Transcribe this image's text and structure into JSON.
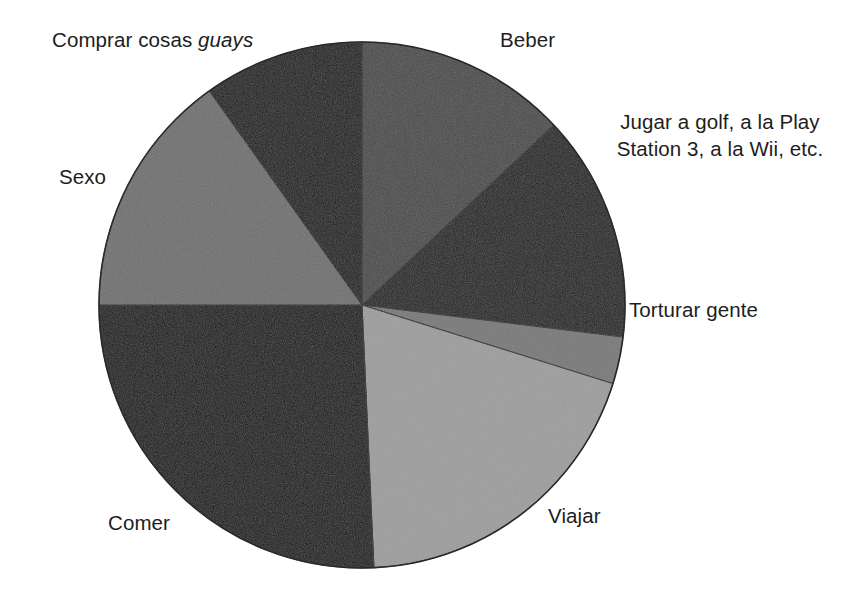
{
  "figure": {
    "background_color": "#ffffff",
    "outline_color": "#1a1a1a"
  },
  "chart_data": {
    "type": "pie",
    "title": "",
    "subtitle": "",
    "xlabel": "",
    "ylabel": "",
    "grid": false,
    "legend_position": "none",
    "label_placement": "outside-callout",
    "start_angle_deg": 0,
    "direction": "clockwise",
    "center": {
      "x": 362,
      "y": 305
    },
    "radius": 263,
    "categories": [
      "Beber",
      "Jugar a golf, a la Play Station 3, a la Wii, etc.",
      "Torturar gente",
      "Viajar",
      "Comer",
      "Sexo",
      "Comprar cosas guays"
    ],
    "values": [
      13.0,
      13.9,
      2.9,
      19.4,
      25.8,
      15.1,
      9.9
    ],
    "value_unit": "percent",
    "slices": [
      {
        "label": "Beber",
        "label_html": "Beber",
        "value": 13.0,
        "start_deg": 0.0,
        "end_deg": 46.8,
        "color": "#4a4a4a"
      },
      {
        "label": "Jugar a golf, a la Play Station 3, a la Wii, etc.",
        "label_line1": "Jugar a golf, a la Play",
        "label_line2": "Station 3, a la Wii, etc.",
        "value": 13.9,
        "start_deg": 46.8,
        "end_deg": 97.0,
        "color": "#1f1f1f"
      },
      {
        "label": "Torturar gente",
        "label_html": "Torturar gente",
        "value": 2.9,
        "start_deg": 97.0,
        "end_deg": 107.4,
        "color": "#787878"
      },
      {
        "label": "Viajar",
        "label_html": "Viajar",
        "value": 19.4,
        "start_deg": 107.4,
        "end_deg": 177.4,
        "color": "#9d9d9d"
      },
      {
        "label": "Comer",
        "label_html": "Comer",
        "value": 25.8,
        "start_deg": 177.4,
        "end_deg": 270.0,
        "color": "#121212"
      },
      {
        "label": "Sexo",
        "label_html": "Sexo",
        "value": 15.1,
        "start_deg": 270.0,
        "end_deg": 324.5,
        "color": "#707070"
      },
      {
        "label": "Comprar cosas guays",
        "label_prefix": "Comprar cosas ",
        "label_emphasis": "guays",
        "value": 9.9,
        "start_deg": 324.5,
        "end_deg": 360.0,
        "color": "#181818"
      }
    ]
  }
}
